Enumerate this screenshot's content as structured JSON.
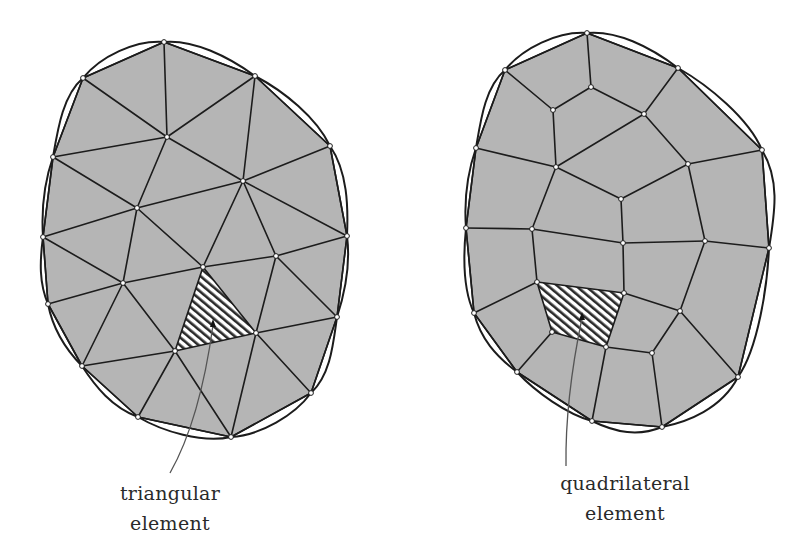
{
  "colors": {
    "fill": "#b5b5b5",
    "stroke": "#1c1c1c",
    "hatch": "#2a2a2a",
    "background": "#ffffff",
    "leader": "#555555"
  },
  "triangular_mesh": {
    "label_line1": "triangular",
    "label_line2": "element",
    "nodes": {
      "A": [
        164,
        42
      ],
      "B": [
        83,
        78
      ],
      "C": [
        255,
        76
      ],
      "D": [
        167,
        137
      ],
      "E": [
        53,
        157
      ],
      "F": [
        330,
        146
      ],
      "G": [
        243,
        181
      ],
      "H": [
        137,
        208
      ],
      "I": [
        43,
        237
      ],
      "J": [
        347,
        236
      ],
      "K": [
        276,
        256
      ],
      "L": [
        203,
        267
      ],
      "M": [
        123,
        283
      ],
      "N": [
        48,
        304
      ],
      "O": [
        337,
        317
      ],
      "P": [
        256,
        333
      ],
      "Q": [
        175,
        351
      ],
      "R": [
        82,
        366
      ],
      "S": [
        311,
        393
      ],
      "T": [
        138,
        417
      ],
      "U": [
        231,
        437
      ]
    },
    "boundary": [
      "A",
      "C",
      "F",
      "J",
      "O",
      "S",
      "U",
      "T",
      "R",
      "N",
      "I",
      "E",
      "B"
    ],
    "edges": [
      [
        "A",
        "B"
      ],
      [
        "A",
        "C"
      ],
      [
        "A",
        "D"
      ],
      [
        "B",
        "D"
      ],
      [
        "C",
        "D"
      ],
      [
        "B",
        "E"
      ],
      [
        "C",
        "G"
      ],
      [
        "C",
        "F"
      ],
      [
        "D",
        "E"
      ],
      [
        "D",
        "G"
      ],
      [
        "D",
        "H"
      ],
      [
        "E",
        "H"
      ],
      [
        "E",
        "I"
      ],
      [
        "F",
        "G"
      ],
      [
        "F",
        "J"
      ],
      [
        "G",
        "H"
      ],
      [
        "G",
        "L"
      ],
      [
        "G",
        "K"
      ],
      [
        "G",
        "J"
      ],
      [
        "H",
        "I"
      ],
      [
        "H",
        "L"
      ],
      [
        "H",
        "M"
      ],
      [
        "I",
        "M"
      ],
      [
        "I",
        "N"
      ],
      [
        "J",
        "K"
      ],
      [
        "J",
        "O"
      ],
      [
        "K",
        "L"
      ],
      [
        "K",
        "P"
      ],
      [
        "K",
        "O"
      ],
      [
        "L",
        "P"
      ],
      [
        "L",
        "Q"
      ],
      [
        "L",
        "M"
      ],
      [
        "M",
        "Q"
      ],
      [
        "M",
        "N"
      ],
      [
        "M",
        "R"
      ],
      [
        "N",
        "R"
      ],
      [
        "O",
        "P"
      ],
      [
        "O",
        "S"
      ],
      [
        "P",
        "Q"
      ],
      [
        "P",
        "S"
      ],
      [
        "P",
        "U"
      ],
      [
        "Q",
        "R"
      ],
      [
        "Q",
        "T"
      ],
      [
        "Q",
        "U"
      ],
      [
        "R",
        "T"
      ],
      [
        "T",
        "U"
      ],
      [
        "U",
        "S"
      ]
    ],
    "highlighted_element": [
      "L",
      "P",
      "Q"
    ],
    "leader": {
      "from": [
        213,
        325
      ],
      "ctrl": [
        200,
        420
      ],
      "to": [
        170,
        473
      ]
    }
  },
  "quadrilateral_mesh": {
    "label_line1": "quadrilateral",
    "label_line2": "element",
    "nodes": {
      "a": [
        587,
        33
      ],
      "b": [
        505,
        70
      ],
      "c": [
        678,
        68
      ],
      "d": [
        591,
        87
      ],
      "e": [
        553,
        110
      ],
      "f": [
        644,
        114
      ],
      "g": [
        476,
        148
      ],
      "h": [
        762,
        150
      ],
      "i": [
        556,
        167
      ],
      "j": [
        688,
        164
      ],
      "k": [
        621,
        199
      ],
      "l": [
        466,
        228
      ],
      "m": [
        532,
        229
      ],
      "n": [
        623,
        243
      ],
      "o": [
        705,
        241
      ],
      "p": [
        769,
        248
      ],
      "q": [
        537,
        282
      ],
      "r": [
        624,
        293
      ],
      "s": [
        474,
        313
      ],
      "t": [
        680,
        311
      ],
      "u": [
        552,
        332
      ],
      "v": [
        606,
        347
      ],
      "w": [
        652,
        353
      ],
      "x": [
        517,
        372
      ],
      "y": [
        738,
        377
      ],
      "z": [
        592,
        421
      ],
      "z2": [
        662,
        427
      ]
    },
    "boundary": [
      "a",
      "c",
      "h",
      "p",
      "y",
      "z2",
      "z",
      "x",
      "s",
      "l",
      "g",
      "b"
    ],
    "edges": [
      [
        "a",
        "b"
      ],
      [
        "a",
        "c"
      ],
      [
        "a",
        "d"
      ],
      [
        "b",
        "e"
      ],
      [
        "d",
        "e"
      ],
      [
        "d",
        "f"
      ],
      [
        "c",
        "f"
      ],
      [
        "b",
        "g"
      ],
      [
        "e",
        "i"
      ],
      [
        "f",
        "i"
      ],
      [
        "f",
        "j"
      ],
      [
        "c",
        "h"
      ],
      [
        "g",
        "i"
      ],
      [
        "j",
        "h"
      ],
      [
        "i",
        "k"
      ],
      [
        "j",
        "k"
      ],
      [
        "j",
        "o"
      ],
      [
        "g",
        "l"
      ],
      [
        "i",
        "m"
      ],
      [
        "k",
        "n"
      ],
      [
        "h",
        "p"
      ],
      [
        "l",
        "m"
      ],
      [
        "m",
        "n"
      ],
      [
        "n",
        "o"
      ],
      [
        "o",
        "p"
      ],
      [
        "m",
        "q"
      ],
      [
        "n",
        "r"
      ],
      [
        "q",
        "r"
      ],
      [
        "l",
        "s"
      ],
      [
        "o",
        "t"
      ],
      [
        "p",
        "y"
      ],
      [
        "r",
        "t"
      ],
      [
        "q",
        "s"
      ],
      [
        "q",
        "u"
      ],
      [
        "r",
        "v"
      ],
      [
        "t",
        "w"
      ],
      [
        "s",
        "x"
      ],
      [
        "u",
        "x"
      ],
      [
        "u",
        "v"
      ],
      [
        "v",
        "w"
      ],
      [
        "t",
        "y"
      ],
      [
        "v",
        "z"
      ],
      [
        "w",
        "z2"
      ],
      [
        "x",
        "z"
      ],
      [
        "z",
        "z2"
      ],
      [
        "z2",
        "y"
      ]
    ],
    "highlighted_element": [
      "q",
      "r",
      "v",
      "u"
    ],
    "leader": {
      "from": [
        582,
        318
      ],
      "ctrl": [
        565,
        400
      ],
      "to": [
        566,
        466
      ]
    }
  }
}
